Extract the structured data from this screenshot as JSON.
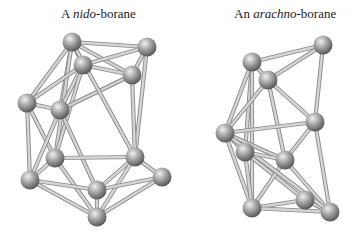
{
  "labels": {
    "left": {
      "article": "A ",
      "prefix": "nido",
      "suffix": "-borane"
    },
    "right": {
      "article": "An ",
      "prefix": "arachno",
      "suffix": "-borane"
    }
  },
  "colors": {
    "sphere_light": "#e6e6e6",
    "sphere_mid": "#a0a0a0",
    "sphere_dark": "#5a5a5a",
    "bond": "#d4d4d4",
    "bond_edge": "#8a8a8a",
    "background": "#ffffff"
  },
  "structures": [
    {
      "name": "nido-borane",
      "atoms": [
        [
          72,
          42
        ],
        [
          147,
          47
        ],
        [
          83,
          65
        ],
        [
          132,
          75
        ],
        [
          27,
          103
        ],
        [
          60,
          110
        ],
        [
          55,
          158
        ],
        [
          135,
          157
        ],
        [
          30,
          180
        ],
        [
          162,
          177
        ],
        [
          97,
          190
        ],
        [
          97,
          217
        ]
      ],
      "bonds": [
        [
          0,
          1
        ],
        [
          0,
          2
        ],
        [
          0,
          3
        ],
        [
          0,
          4
        ],
        [
          0,
          5
        ],
        [
          0,
          6
        ],
        [
          1,
          2
        ],
        [
          1,
          3
        ],
        [
          1,
          7
        ],
        [
          2,
          3
        ],
        [
          2,
          5
        ],
        [
          2,
          6
        ],
        [
          2,
          4
        ],
        [
          3,
          5
        ],
        [
          3,
          7
        ],
        [
          4,
          5
        ],
        [
          4,
          6
        ],
        [
          4,
          8
        ],
        [
          5,
          8
        ],
        [
          5,
          10
        ],
        [
          6,
          7
        ],
        [
          6,
          8
        ],
        [
          6,
          11
        ],
        [
          7,
          9
        ],
        [
          7,
          10
        ],
        [
          7,
          11
        ],
        [
          8,
          10
        ],
        [
          8,
          11
        ],
        [
          9,
          10
        ],
        [
          9,
          11
        ],
        [
          10,
          11
        ],
        [
          0,
          7
        ]
      ]
    },
    {
      "name": "arachno-borane",
      "atoms": [
        [
          323,
          45
        ],
        [
          252,
          62
        ],
        [
          268,
          80
        ],
        [
          315,
          122
        ],
        [
          225,
          133
        ],
        [
          245,
          152
        ],
        [
          285,
          160
        ],
        [
          305,
          200
        ],
        [
          252,
          208
        ],
        [
          330,
          212
        ]
      ],
      "bonds": [
        [
          0,
          1
        ],
        [
          0,
          2
        ],
        [
          0,
          3
        ],
        [
          1,
          2
        ],
        [
          1,
          4
        ],
        [
          1,
          5
        ],
        [
          1,
          8
        ],
        [
          2,
          3
        ],
        [
          2,
          4
        ],
        [
          2,
          6
        ],
        [
          3,
          4
        ],
        [
          3,
          6
        ],
        [
          3,
          9
        ],
        [
          4,
          5
        ],
        [
          4,
          6
        ],
        [
          4,
          8
        ],
        [
          5,
          7
        ],
        [
          5,
          8
        ],
        [
          6,
          8
        ],
        [
          6,
          9
        ],
        [
          7,
          8
        ],
        [
          7,
          9
        ],
        [
          8,
          9
        ],
        [
          4,
          9
        ],
        [
          5,
          6
        ]
      ]
    }
  ]
}
